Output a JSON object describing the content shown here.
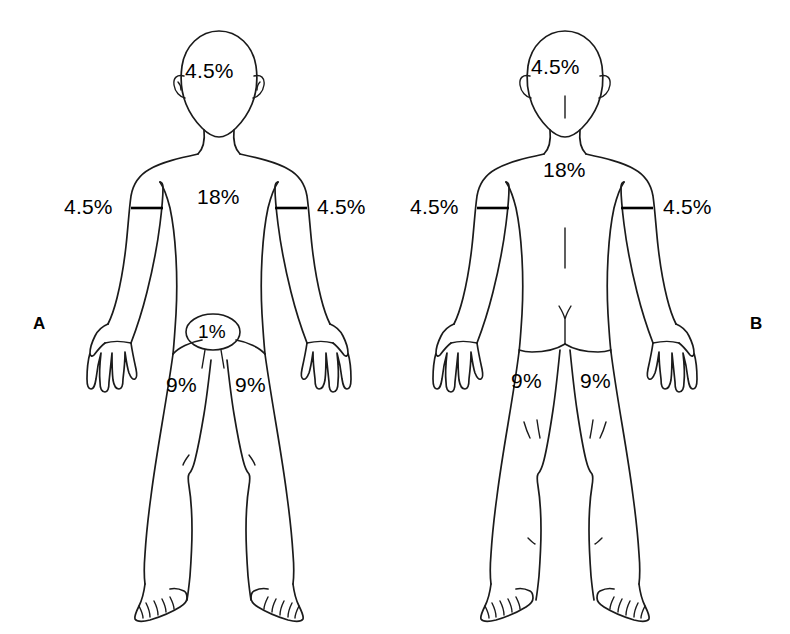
{
  "figure": {
    "background_color": "#ffffff",
    "line_color": "#1b1b1b",
    "text_color": "#000000"
  },
  "panels": [
    {
      "id": "A",
      "letter": "A",
      "view": "anterior",
      "labels": {
        "head": "4.5%",
        "trunk": "18%",
        "left_arm": "4.5%",
        "right_arm": "4.5%",
        "genitalia": "1%",
        "left_leg": "9%",
        "right_leg": "9%"
      }
    },
    {
      "id": "B",
      "letter": "B",
      "view": "posterior",
      "labels": {
        "head": "4.5%",
        "trunk": "18%",
        "left_arm": "4.5%",
        "right_arm": "4.5%",
        "left_leg": "9%",
        "right_leg": "9%"
      }
    }
  ],
  "annotations": {
    "a_head_pct": "4.5%",
    "a_trunk_pct": "18%",
    "a_arm_left_pct": "4.5%",
    "a_arm_right_pct": "4.5%",
    "a_genital_pct": "1%",
    "a_leg_left_pct": "9%",
    "a_leg_right_pct": "9%",
    "b_head_pct": "4.5%",
    "b_trunk_pct": "18%",
    "b_arm_left_pct": "4.5%",
    "b_arm_right_pct": "4.5%",
    "b_leg_left_pct": "9%",
    "b_leg_right_pct": "9%",
    "panel_a_letter": "A",
    "panel_b_letter": "B"
  }
}
